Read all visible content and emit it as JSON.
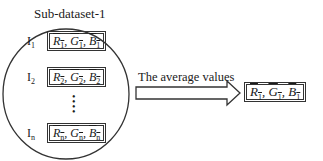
{
  "diagram": {
    "group_title": "Sub-dataset-1",
    "items": [
      {
        "index_label": "I",
        "index_sub": "1",
        "values": [
          {
            "sym": "R",
            "sub": "1"
          },
          {
            "sym": "G",
            "sub": "1"
          },
          {
            "sym": "B",
            "sub": "1"
          }
        ]
      },
      {
        "index_label": "I",
        "index_sub": "2",
        "values": [
          {
            "sym": "R",
            "sub": "2"
          },
          {
            "sym": "G",
            "sub": "2"
          },
          {
            "sym": "B",
            "sub": "2"
          }
        ]
      },
      {
        "index_label": "I",
        "index_sub": "n",
        "values": [
          {
            "sym": "R",
            "sub": "n"
          },
          {
            "sym": "G",
            "sub": "n"
          },
          {
            "sym": "B",
            "sub": "n"
          }
        ]
      }
    ],
    "ellipsis": "•\n•\n•\n•",
    "arrow_label": "The average values",
    "result": {
      "values": [
        {
          "sym": "R",
          "sub": "1"
        },
        {
          "sym": "G",
          "sub": "1"
        },
        {
          "sym": "B",
          "sub": "1"
        }
      ]
    },
    "separator": ", ",
    "colors": {
      "stroke": "#333333",
      "text": "#1a1a1a",
      "background": "#ffffff"
    }
  }
}
